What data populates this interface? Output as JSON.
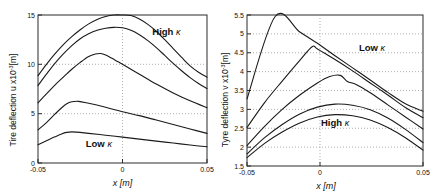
{
  "figure": {
    "background": "#ffffff",
    "curve_color": "#1a1a1a",
    "axis_color": "#2b2b2b",
    "grid_color": "#8d8d8d",
    "width": 433,
    "height": 193
  },
  "chart_data": [
    {
      "id": "left",
      "type": "line",
      "title": "",
      "xlabel": "x [m]",
      "ylabel": "Tire deflection u x10",
      "ylabel_sup": "-3",
      "ylabel_unit": "[m]",
      "xlim": [
        -0.05,
        0.05
      ],
      "ylim": [
        0,
        15
      ],
      "xticks": [
        -0.05,
        0,
        0.05
      ],
      "xticklabels": [
        "-0.05",
        "0",
        "0.05"
      ],
      "yticks": [
        0,
        5,
        10,
        15
      ],
      "yticklabels": [
        "0",
        "5",
        "10",
        "15"
      ],
      "grid": true,
      "legend": "none",
      "annotations": [
        {
          "text": "High",
          "kappa": "κ",
          "x": 0.026,
          "y": 13.0
        },
        {
          "text": "Low",
          "kappa": "κ",
          "x": -0.014,
          "y": 1.6
        }
      ],
      "series": [
        {
          "name": "curve-1-high-kappa",
          "x": [
            -0.05,
            -0.045,
            -0.04,
            -0.035,
            -0.03,
            -0.025,
            -0.02,
            -0.015,
            -0.01,
            -0.005,
            0.0,
            0.005,
            0.01,
            0.015,
            0.02,
            0.025,
            0.03,
            0.035,
            0.04,
            0.045,
            0.05
          ],
          "y": [
            8.85,
            10.0,
            11.05,
            12.0,
            12.8,
            13.5,
            14.1,
            14.55,
            14.85,
            15.0,
            15.0,
            14.95,
            14.6,
            14.05,
            13.35,
            12.5,
            11.6,
            10.7,
            9.85,
            9.2,
            8.7
          ]
        },
        {
          "name": "curve-2",
          "x": [
            -0.05,
            -0.045,
            -0.04,
            -0.035,
            -0.03,
            -0.025,
            -0.02,
            -0.015,
            -0.01,
            -0.005,
            0.0,
            0.005,
            0.01,
            0.015,
            0.02,
            0.025,
            0.03,
            0.035,
            0.04,
            0.045,
            0.05
          ],
          "y": [
            7.85,
            9.0,
            10.1,
            11.05,
            11.9,
            12.6,
            13.1,
            13.45,
            13.65,
            13.75,
            13.7,
            13.45,
            13.0,
            12.4,
            11.7,
            10.9,
            10.1,
            9.35,
            8.65,
            8.05,
            7.55
          ]
        },
        {
          "name": "curve-3",
          "x": [
            -0.05,
            -0.045,
            -0.04,
            -0.035,
            -0.03,
            -0.025,
            -0.02,
            -0.016,
            -0.013,
            -0.01,
            -0.005,
            0.0,
            0.01,
            0.02,
            0.03,
            0.04,
            0.05
          ],
          "y": [
            6.1,
            7.0,
            7.9,
            8.7,
            9.5,
            10.2,
            10.8,
            11.05,
            11.1,
            10.95,
            10.5,
            10.0,
            9.0,
            8.0,
            7.1,
            6.3,
            5.6
          ]
        },
        {
          "name": "curve-4",
          "x": [
            -0.05,
            -0.045,
            -0.04,
            -0.036,
            -0.033,
            -0.03,
            -0.026,
            -0.02,
            -0.01,
            0.0,
            0.01,
            0.02,
            0.03,
            0.04,
            0.05
          ],
          "y": [
            3.35,
            4.1,
            4.95,
            5.6,
            6.0,
            6.2,
            6.25,
            6.05,
            5.65,
            5.2,
            4.8,
            4.35,
            3.9,
            3.45,
            3.0
          ]
        },
        {
          "name": "curve-5-low-kappa",
          "x": [
            -0.05,
            -0.045,
            -0.04,
            -0.036,
            -0.033,
            -0.03,
            -0.025,
            -0.02,
            -0.01,
            0.0,
            0.01,
            0.02,
            0.03,
            0.04,
            0.05
          ],
          "y": [
            1.85,
            2.25,
            2.65,
            2.95,
            3.1,
            3.15,
            3.1,
            3.0,
            2.82,
            2.62,
            2.42,
            2.22,
            2.02,
            1.82,
            1.65
          ]
        }
      ]
    },
    {
      "id": "right",
      "type": "line",
      "title": "",
      "xlabel": "x [m]",
      "ylabel": "Tyre deflection v x10",
      "ylabel_sup": "-3",
      "ylabel_unit": "[m]",
      "xlim": [
        -0.05,
        0.05
      ],
      "ylim": [
        1.5,
        5.5
      ],
      "xticks": [
        -0.05,
        0,
        0.05
      ],
      "xticklabels": [
        "-0.05",
        "0",
        "0.05"
      ],
      "yticks": [
        1.5,
        2,
        2.5,
        3,
        3.5,
        4,
        4.5,
        5,
        5.5
      ],
      "yticklabels": [
        "1.5",
        "2",
        "2.5",
        "3",
        "3.5",
        "4",
        "4.5",
        "5",
        "5.5"
      ],
      "grid": true,
      "legend": "none",
      "annotations": [
        {
          "text": "Low",
          "kappa": "κ",
          "x": 0.021,
          "y": 4.55
        },
        {
          "text": "High",
          "kappa": "κ",
          "x": 0.0,
          "y": 2.55
        }
      ],
      "series": [
        {
          "name": "curve-1-low-kappa",
          "x": [
            -0.05,
            -0.034,
            -0.02,
            -0.01,
            0.0,
            0.01,
            0.02,
            0.03,
            0.04,
            0.05
          ],
          "y": [
            3.28,
            5.46,
            5.05,
            4.75,
            4.42,
            4.1,
            3.78,
            3.45,
            3.15,
            2.95
          ]
        },
        {
          "name": "curve-2",
          "x": [
            -0.05,
            -0.04,
            -0.03,
            -0.02,
            -0.013,
            -0.01,
            0.0,
            0.01,
            0.02,
            0.03,
            0.04,
            0.05
          ],
          "y": [
            2.52,
            3.18,
            3.75,
            4.3,
            4.66,
            4.6,
            4.32,
            4.02,
            3.7,
            3.38,
            3.05,
            2.78
          ]
        },
        {
          "name": "curve-3",
          "x": [
            -0.05,
            -0.04,
            -0.03,
            -0.02,
            -0.01,
            -0.003,
            0.003,
            0.007,
            0.012,
            0.02,
            0.03,
            0.04,
            0.05
          ],
          "y": [
            2.04,
            2.55,
            3.0,
            3.38,
            3.7,
            3.87,
            3.9,
            3.74,
            3.66,
            3.44,
            3.12,
            2.8,
            2.48
          ]
        },
        {
          "name": "curve-4",
          "x": [
            -0.05,
            -0.04,
            -0.03,
            -0.02,
            -0.01,
            0.0,
            0.01,
            0.02,
            0.03,
            0.04,
            0.05
          ],
          "y": [
            1.82,
            2.25,
            2.6,
            2.88,
            3.06,
            3.14,
            3.11,
            2.99,
            2.77,
            2.47,
            2.12
          ]
        },
        {
          "name": "curve-5-high-kappa",
          "x": [
            -0.05,
            -0.04,
            -0.03,
            -0.02,
            -0.01,
            0.0,
            0.01,
            0.02,
            0.03,
            0.04,
            0.05
          ],
          "y": [
            1.72,
            2.1,
            2.4,
            2.64,
            2.8,
            2.86,
            2.83,
            2.72,
            2.52,
            2.25,
            1.92
          ]
        }
      ]
    }
  ]
}
